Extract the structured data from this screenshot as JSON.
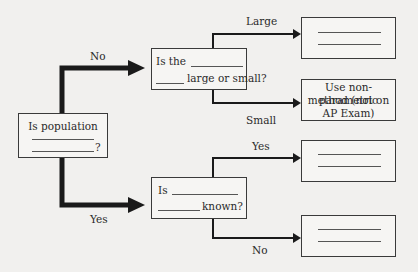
{
  "diagram": {
    "root": {
      "text_line1": "Is population",
      "text_end": "?"
    },
    "edges": {
      "no": "No",
      "yes": "Yes",
      "large": "Large",
      "small": "Small",
      "yes2": "Yes",
      "no2": "No"
    },
    "node_size": {
      "prefix": "Is the",
      "suffix": "large or small?"
    },
    "node_known": {
      "prefix": "Is",
      "suffix": "known?"
    },
    "result_nonparam": {
      "line1": "Use non-parametric",
      "line2": "method (not on",
      "line3": "AP Exam)"
    }
  }
}
